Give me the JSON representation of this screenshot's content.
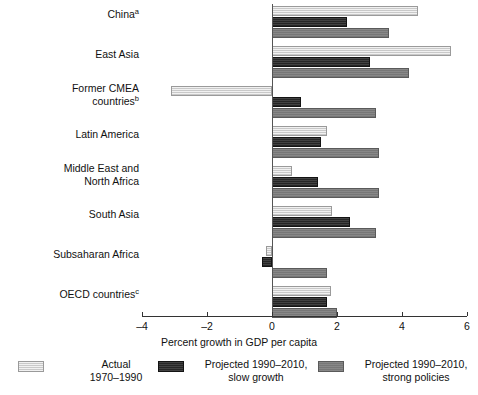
{
  "chart_data": {
    "type": "bar",
    "orientation": "horizontal",
    "title": "",
    "xlabel": "Percent growth in GDP per capita",
    "ylabel": "",
    "xlim": [
      -4,
      6
    ],
    "xticks": [
      -4,
      -2,
      0,
      2,
      4,
      6
    ],
    "xtick_labels": [
      "–4",
      "–2",
      "0",
      "2",
      "4",
      "6"
    ],
    "grid": false,
    "legend_position": "bottom",
    "categories": [
      "Chinaᵃ",
      "East Asia",
      "Former CMEA\ncountriesᵇ",
      "Latin America",
      "Middle East and\nNorth Africa",
      "South Asia",
      "Subsaharan Africa",
      "OECD countriesᶜ"
    ],
    "series": [
      {
        "name": "Actual 1970–1990",
        "key": "actual",
        "color": "#c9c9c9",
        "values": [
          4.5,
          5.5,
          -3.1,
          1.7,
          0.6,
          1.85,
          -0.2,
          1.8
        ]
      },
      {
        "name": "Projected 1990–2010, slow growth",
        "key": "slow",
        "color": "#262626",
        "values": [
          2.3,
          3.0,
          0.9,
          1.5,
          1.4,
          2.4,
          -0.3,
          1.7
        ]
      },
      {
        "name": "Projected 1990–2010, strong policies",
        "key": "strong",
        "color": "#777777",
        "values": [
          3.6,
          4.2,
          3.2,
          3.3,
          3.3,
          3.2,
          1.7,
          2.0
        ]
      }
    ]
  },
  "axis": {
    "title": "Percent growth in GDP per capita",
    "ticks": [
      {
        "label": "–4",
        "value": -4
      },
      {
        "label": "–2",
        "value": -2
      },
      {
        "label": "0",
        "value": 0
      },
      {
        "label": "2",
        "value": 2
      },
      {
        "label": "4",
        "value": 4
      },
      {
        "label": "6",
        "value": 6
      }
    ]
  },
  "categories": [
    {
      "line1": "China",
      "sup": "a",
      "line2": ""
    },
    {
      "line1": "East Asia",
      "sup": "",
      "line2": ""
    },
    {
      "line1": "Former CMEA",
      "sup": "b",
      "line2": "countries"
    },
    {
      "line1": "Latin America",
      "sup": "",
      "line2": ""
    },
    {
      "line1": "Middle East and",
      "sup": "",
      "line2": "North Africa"
    },
    {
      "line1": "South Asia",
      "sup": "",
      "line2": ""
    },
    {
      "line1": "Subsaharan Africa",
      "sup": "",
      "line2": ""
    },
    {
      "line1": "OECD countries",
      "sup": "c",
      "line2": ""
    }
  ],
  "legend": [
    {
      "line1": "Actual",
      "line2": "1970–1990",
      "key": "actual"
    },
    {
      "line1": "Projected 1990–2010,",
      "line2": "slow growth",
      "key": "slow"
    },
    {
      "line1": "Projected 1990–2010,",
      "line2": "strong policies",
      "key": "strong"
    }
  ]
}
